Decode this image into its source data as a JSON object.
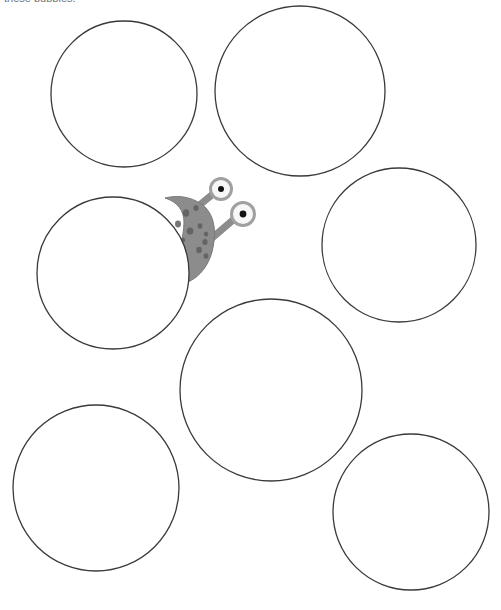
{
  "canvas": {
    "width": 501,
    "height": 610,
    "background": "#ffffff"
  },
  "instruction": {
    "text": "these bubbles.",
    "clipped": "true"
  },
  "style": {
    "bubble_stroke": "#3a3a3a",
    "bubble_fill": "#ffffff",
    "bubble_stroke_width": 1.3,
    "creature_body": "#8c8c8c",
    "creature_body_edge": "#7a7a7a",
    "creature_spot": "#5e5e5e",
    "stalk": "#8c8c8c",
    "eye_ring": "#a0a0a0",
    "eye_white": "#f7f7f7",
    "eye_pupil": "#111111"
  },
  "bubbles": [
    {
      "name": "bubble-top-left",
      "cx": 124,
      "cy": 94,
      "r": 73
    },
    {
      "name": "bubble-top-right",
      "cx": 300,
      "cy": 91,
      "r": 85
    },
    {
      "name": "bubble-middle-left",
      "cx": 113,
      "cy": 273,
      "r": 76
    },
    {
      "name": "bubble-middle-right",
      "cx": 399,
      "cy": 245,
      "r": 77
    },
    {
      "name": "bubble-center-bottom",
      "cx": 271,
      "cy": 390,
      "r": 91
    },
    {
      "name": "bubble-bottom-left",
      "cx": 96,
      "cy": 488,
      "r": 83
    },
    {
      "name": "bubble-bottom-right",
      "cx": 411,
      "cy": 512,
      "r": 78
    }
  ],
  "creature": {
    "label": "monster-character",
    "hidden_behind": "bubble-middle-left",
    "body_spots": [
      {
        "cx": 186,
        "cy": 213,
        "rx": 3.2,
        "ry": 3.8
      },
      {
        "cx": 196,
        "cy": 208,
        "rx": 2.6,
        "ry": 3.0
      },
      {
        "cx": 178,
        "cy": 224,
        "rx": 3.0,
        "ry": 3.4
      },
      {
        "cx": 190,
        "cy": 231,
        "rx": 3.4,
        "ry": 3.6
      },
      {
        "cx": 200,
        "cy": 226,
        "rx": 2.4,
        "ry": 2.8
      },
      {
        "cx": 206,
        "cy": 234,
        "rx": 2.2,
        "ry": 2.6
      },
      {
        "cx": 205,
        "cy": 242,
        "rx": 2.6,
        "ry": 3.0
      },
      {
        "cx": 199,
        "cy": 250,
        "rx": 2.8,
        "ry": 3.2
      },
      {
        "cx": 206,
        "cy": 256,
        "rx": 2.4,
        "ry": 2.8
      },
      {
        "cx": 183,
        "cy": 240,
        "rx": 2.2,
        "ry": 2.6
      }
    ],
    "eyes": [
      {
        "name": "eye-upper",
        "cx": 221,
        "cy": 189,
        "r_ring": 12,
        "r_white": 9,
        "r_pupil": 3
      },
      {
        "name": "eye-lower",
        "cx": 243,
        "cy": 214,
        "r_ring": 13,
        "r_white": 10,
        "r_pupil": 3.4
      }
    ],
    "stalks": [
      {
        "name": "stalk-upper",
        "x1": 191,
        "y1": 212,
        "x2": 213,
        "y2": 194,
        "width": 7
      },
      {
        "name": "stalk-lower",
        "x1": 205,
        "y1": 244,
        "x2": 233,
        "y2": 220,
        "width": 7
      }
    ]
  }
}
